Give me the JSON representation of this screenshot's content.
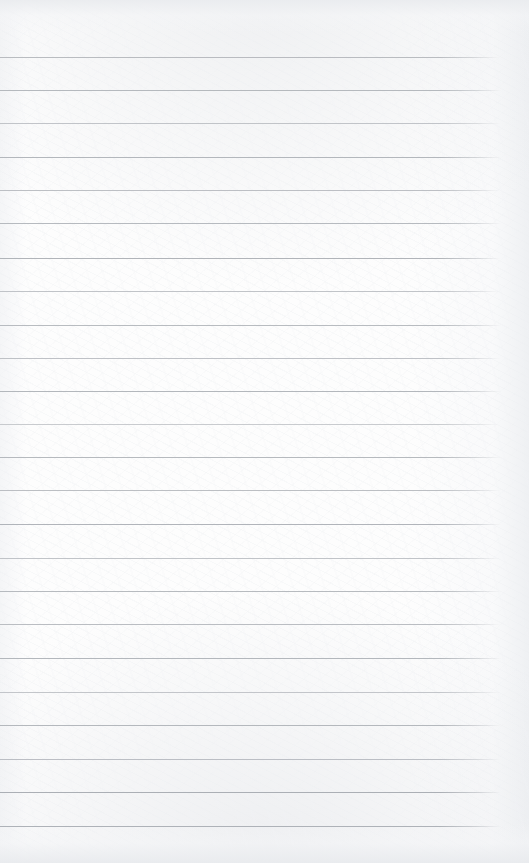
{
  "document": {
    "kind": "scanned-lined-paper",
    "page_width": 529,
    "page_height": 863,
    "content_text": "",
    "writing_present": false
  },
  "paper": {
    "background_color": "#fdfdfd",
    "edge_shade_color": "#eaecef",
    "right_margin_shade_color": "#eceef1"
  },
  "ruling": {
    "line_count": 24,
    "first_line_y": 57,
    "line_spacing": 33.4,
    "line_start_x": 0,
    "line_end_x": 500,
    "line_thickness": 1,
    "lines": [
      {
        "y": 57,
        "color": "#b6b9be",
        "opacity": 0.95,
        "end_x": 499
      },
      {
        "y": 90,
        "color": "#b2b6bb",
        "opacity": 0.95,
        "end_x": 501
      },
      {
        "y": 123,
        "color": "#bcbfc4",
        "opacity": 0.9,
        "end_x": 500
      },
      {
        "y": 157,
        "color": "#b0b4b9",
        "opacity": 0.95,
        "end_x": 501
      },
      {
        "y": 190,
        "color": "#b8bbc0",
        "opacity": 0.92,
        "end_x": 500
      },
      {
        "y": 223,
        "color": "#b3b7bc",
        "opacity": 0.95,
        "end_x": 501
      },
      {
        "y": 258,
        "color": "#aeb2b7",
        "opacity": 0.96,
        "end_x": 500
      },
      {
        "y": 291,
        "color": "#bbbec3",
        "opacity": 0.9,
        "end_x": 499
      },
      {
        "y": 325,
        "color": "#b4b8bd",
        "opacity": 0.94,
        "end_x": 501
      },
      {
        "y": 358,
        "color": "#b9bcc1",
        "opacity": 0.91,
        "end_x": 500
      },
      {
        "y": 391,
        "color": "#b0b4b9",
        "opacity": 0.95,
        "end_x": 501
      },
      {
        "y": 424,
        "color": "#c0c3c7",
        "opacity": 0.85,
        "end_x": 499
      },
      {
        "y": 457,
        "color": "#b2b6bb",
        "opacity": 0.94,
        "end_x": 501
      },
      {
        "y": 490,
        "color": "#b7babf",
        "opacity": 0.92,
        "end_x": 500
      },
      {
        "y": 524,
        "color": "#aeb2b8",
        "opacity": 0.96,
        "end_x": 501
      },
      {
        "y": 558,
        "color": "#babdc2",
        "opacity": 0.89,
        "end_x": 500
      },
      {
        "y": 591,
        "color": "#b3b7bc",
        "opacity": 0.94,
        "end_x": 501
      },
      {
        "y": 624,
        "color": "#b6b9be",
        "opacity": 0.93,
        "end_x": 500
      },
      {
        "y": 658,
        "color": "#b0b4b9",
        "opacity": 0.95,
        "end_x": 501
      },
      {
        "y": 692,
        "color": "#bcbfc4",
        "opacity": 0.88,
        "end_x": 500
      },
      {
        "y": 725,
        "color": "#b1b5ba",
        "opacity": 0.95,
        "end_x": 501
      },
      {
        "y": 759,
        "color": "#b7bac0",
        "opacity": 0.92,
        "end_x": 500
      },
      {
        "y": 792,
        "color": "#a9adb3",
        "opacity": 0.97,
        "end_x": 501
      },
      {
        "y": 826,
        "color": "#acb0b6",
        "opacity": 0.96,
        "end_x": 501
      }
    ]
  }
}
